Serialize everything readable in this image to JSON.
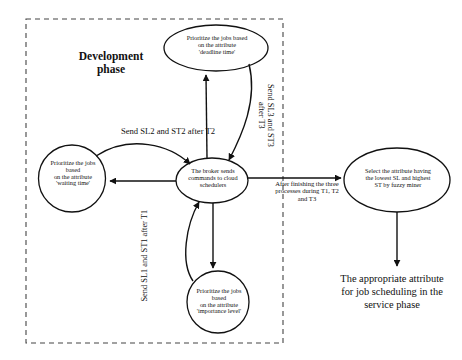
{
  "diagram": {
    "phase_box": {
      "title": "Development\nphase",
      "style": "dashed"
    },
    "nodes": [
      {
        "id": "deadline",
        "shape": "ellipse",
        "text": "Prioritize the jobs based\non the attribute\n'deadline time'"
      },
      {
        "id": "waiting",
        "shape": "circle",
        "text": "Prioritize the jobs\nbased\non the attribute\n'waiting time'"
      },
      {
        "id": "broker",
        "shape": "ellipse",
        "text": "The broker sends\ncommands to cloud\nschedulers"
      },
      {
        "id": "importance",
        "shape": "circle",
        "text": "Prioritize the jobs\nbased\non the attribute\n'importance level'"
      },
      {
        "id": "select",
        "shape": "ellipse",
        "text": "Select the attribute having\nthe lowest SL and highest\nST by fuzzy miner"
      }
    ],
    "edge_labels": {
      "sl2_st2": "Send SL2 and ST2 after T2",
      "sl1_st1": "Send SL1 and ST1 after T1",
      "sl3_st3": "Send SL3 and ST3\nafter T3",
      "after_three": "After finishing the three\nprocesses during T1, T2\nand T3"
    },
    "outcome": "The appropriate attribute\nfor job scheduling in the\nservice phase",
    "colors": {
      "stroke": "#111111",
      "background": "#ffffff",
      "dashed_border": "#444444"
    }
  }
}
